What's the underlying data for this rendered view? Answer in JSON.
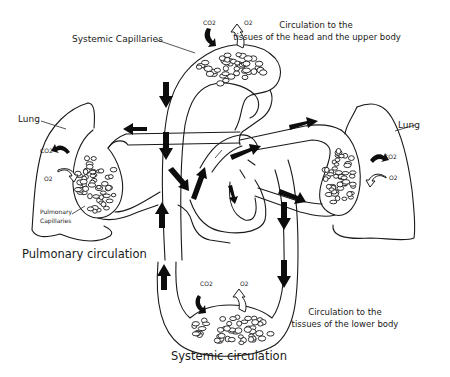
{
  "diagram": {
    "title_top_right": {
      "line1": "Circulation to the",
      "line2": "tissues of the head and the upper body"
    },
    "title_bottom_right": {
      "line1": "Circulation to the",
      "line2": "tissues of the lower body"
    },
    "labels": {
      "systemic_capillaries": "Systemic Capillaries",
      "lung_left": "Lung",
      "lung_right": "Lung",
      "pulmonary_capillaries_line1": "Pulmonary",
      "pulmonary_capillaries_line2": "Capillaries",
      "pulmonary_circulation": "Pulmonary circulation",
      "systemic_circulation": "Systemic circulation"
    },
    "gas_labels": {
      "top_co2": "CO2",
      "top_o2": "O2",
      "left_co2": "CO2",
      "left_o2": "O2",
      "right_co2": "CO2",
      "right_o2": "O2",
      "bottom_co2": "CO2",
      "bottom_o2": "O2"
    },
    "colors": {
      "line": "#1a1a1a",
      "arrow": "#0d0d0d",
      "background": "#ffffff"
    }
  }
}
